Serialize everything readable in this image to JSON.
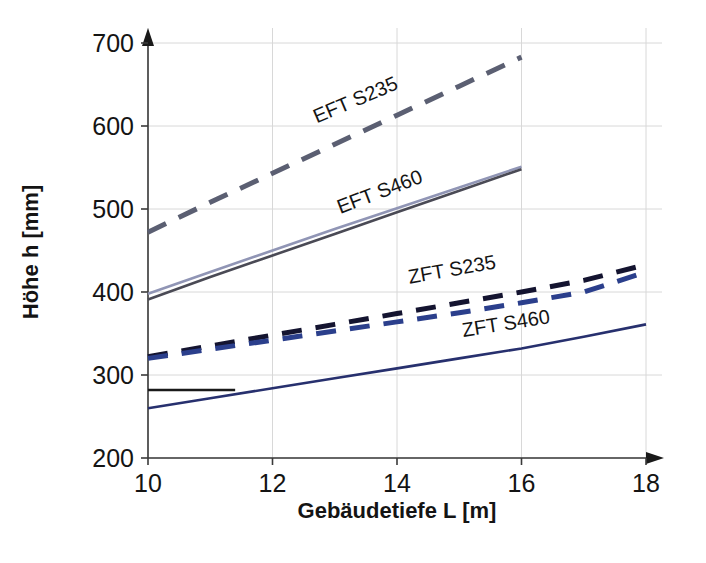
{
  "chart_data": {
    "type": "line",
    "title": "",
    "xlabel": "Gebäudetiefe L [m]",
    "ylabel": "Höhe h [mm]",
    "xlim": [
      10,
      18
    ],
    "ylim": [
      200,
      700
    ],
    "xticks": [
      "10",
      "12",
      "14",
      "16",
      "18"
    ],
    "yticks": [
      "200",
      "300",
      "400",
      "500",
      "600",
      "700"
    ],
    "grid": true,
    "legend_position": "inline-labels",
    "series": [
      {
        "name": "EFT S235",
        "label": "EFT S235",
        "style": "dashed",
        "color": "#5b5f72",
        "x": [
          10,
          11,
          12,
          13,
          14,
          15,
          16
        ],
        "values": [
          472,
          508,
          543,
          578,
          613,
          648,
          683
        ]
      },
      {
        "name": "EFT S460 (upper)",
        "label": "EFT S460",
        "style": "solid",
        "color": "#9095b5",
        "x": [
          10,
          11,
          12,
          13,
          14,
          15,
          16
        ],
        "values": [
          398,
          424,
          450,
          476,
          501,
          526,
          551
        ]
      },
      {
        "name": "EFT S460 (lower)",
        "label": "",
        "style": "solid",
        "color": "#4a4a55",
        "x": [
          10,
          11,
          12,
          13,
          14,
          15,
          16
        ],
        "values": [
          391,
          418,
          444,
          470,
          496,
          522,
          548
        ]
      },
      {
        "name": "ZFT S235 (upper)",
        "label": "ZFT S235",
        "style": "dashed",
        "color": "#141430",
        "x": [
          10,
          11,
          12,
          13,
          14,
          15,
          16,
          17,
          18
        ],
        "values": [
          322,
          335,
          348,
          361,
          374,
          387,
          400,
          414,
          433
        ]
      },
      {
        "name": "ZFT S235 (lower)",
        "label": "",
        "style": "dashed",
        "color": "#2b3f8c",
        "x": [
          10,
          11,
          12,
          13,
          14,
          15,
          16,
          17,
          18
        ],
        "values": [
          320,
          331,
          342,
          353,
          364,
          375,
          387,
          400,
          424
        ]
      },
      {
        "name": "ZFT S460",
        "label": "ZFT S460",
        "style": "solid",
        "color": "#27306e",
        "x": [
          10,
          11,
          12,
          13,
          14,
          15,
          16,
          17,
          18
        ],
        "values": [
          260,
          272,
          284,
          296,
          308,
          320,
          332,
          346,
          361
        ]
      },
      {
        "name": "ZFT S460 plateau",
        "label": "",
        "style": "solid",
        "color": "#1a1a1a",
        "x": [
          10,
          11.4
        ],
        "values": [
          282,
          282
        ]
      }
    ],
    "annotations": [
      {
        "text": "EFT S235",
        "x_px": 358,
        "y_px": 106,
        "rotation": -23
      },
      {
        "text": "EFT S460",
        "x_px": 382,
        "y_px": 198,
        "rotation": -21
      },
      {
        "text": "ZFT S235",
        "x_px": 453,
        "y_px": 276,
        "rotation": -10
      },
      {
        "text": "ZFT S460",
        "x_px": 507,
        "y_px": 330,
        "rotation": -9
      }
    ],
    "colors": {
      "eft_s235": "#5b5f72",
      "eft_s460_light": "#9095b5",
      "eft_s460_dark": "#4a4a55",
      "zft_s235_dark": "#141430",
      "zft_s235_blue": "#2b3f8c",
      "zft_s460": "#27306e",
      "axis": "#3a3a3a",
      "grid": "#d8d8d8"
    }
  }
}
